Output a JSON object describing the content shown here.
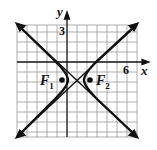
{
  "axes": {
    "x_label": "x",
    "y_label": "y",
    "x_tick": "6",
    "y_tick": "3"
  },
  "foci": {
    "f1": "F",
    "f1_sub": "1",
    "f2": "F",
    "f2_sub": "2"
  },
  "figure": {
    "type": "hyperbola",
    "center": [
      1,
      -2
    ],
    "asymptote_slopes": [
      1,
      -1
    ],
    "grid_range_x": [
      -5,
      7
    ],
    "grid_range_y": [
      -7,
      4
    ]
  }
}
